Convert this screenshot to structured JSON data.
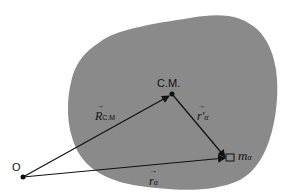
{
  "diagram": {
    "title": "",
    "colors": {
      "body_fill": "#8a8a8a",
      "line": "#111111",
      "background": "#ffffff"
    },
    "points": {
      "origin": {
        "label": "O",
        "x": 23,
        "y": 177
      },
      "center_of_mass": {
        "label": "C.M.",
        "x": 172,
        "y": 94
      },
      "mass_element": {
        "label_base": "m",
        "label_sub": "α",
        "x": 228,
        "y": 158
      }
    },
    "vectors": [
      {
        "id": "R_CM",
        "from": "origin",
        "to": "center_of_mass",
        "label_base": "R",
        "label_sub": "C.M"
      },
      {
        "id": "r_alpha_prime",
        "from": "center_of_mass",
        "to": "mass_element",
        "label_base": "r",
        "label_sub": "α",
        "prime": "′"
      },
      {
        "id": "r_alpha",
        "from": "origin",
        "to": "mass_element",
        "label_base": "r",
        "label_sub": "α"
      }
    ]
  }
}
